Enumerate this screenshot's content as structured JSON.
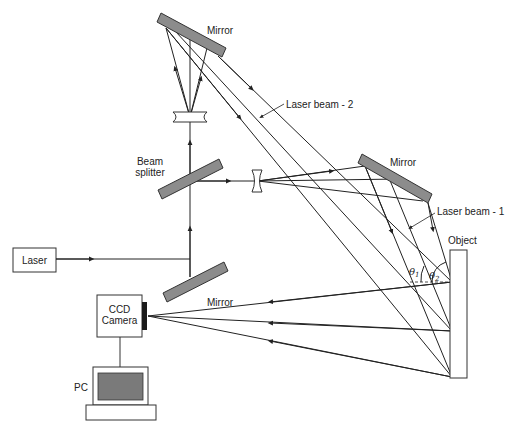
{
  "diagram": {
    "type": "holographic-interferometry-setup",
    "labels": {
      "laser": "Laser",
      "mirror_top": "Mirror",
      "mirror_right": "Mirror",
      "mirror_bottom": "Mirror",
      "beam_splitter_line1": "Beam",
      "beam_splitter_line2": "splitter",
      "laser_beam_1": "Laser beam - 1",
      "laser_beam_2": "Laser beam - 2",
      "object": "Object",
      "ccd_line1": "CCD",
      "ccd_line2": "Camera",
      "pc": "PC",
      "theta1": "θ",
      "theta1_sub": "1",
      "theta2": "θ",
      "theta2_sub": "2"
    },
    "colors": {
      "line": "#222222",
      "mirror_fill": "#8c8c8c",
      "screen_fill": "#7a7a7a",
      "sensor_fill": "#1a1a1a",
      "background": "#ffffff"
    },
    "components": [
      {
        "id": "laser",
        "kind": "box"
      },
      {
        "id": "mirror-bottom",
        "kind": "mirror"
      },
      {
        "id": "beam-splitter",
        "kind": "mirror"
      },
      {
        "id": "lens-top",
        "kind": "concave-lens"
      },
      {
        "id": "mirror-top",
        "kind": "mirror"
      },
      {
        "id": "lens-right",
        "kind": "concave-lens"
      },
      {
        "id": "mirror-right",
        "kind": "mirror"
      },
      {
        "id": "object",
        "kind": "box"
      },
      {
        "id": "ccd-camera",
        "kind": "box"
      },
      {
        "id": "pc",
        "kind": "computer"
      }
    ]
  }
}
